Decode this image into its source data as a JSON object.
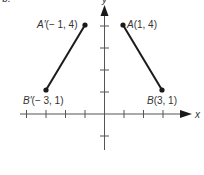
{
  "figure": {
    "part_label": "b.",
    "axis_x_label": "x",
    "axis_y_label": "y",
    "colors": {
      "axis": "#555555",
      "segment": "#1a1a1a",
      "text": "#333333",
      "background": "#ffffff"
    },
    "points": [
      {
        "name": "A",
        "label_name": "A",
        "label_coords": "(1, 4)",
        "x": 1,
        "y": 4
      },
      {
        "name": "B",
        "label_name": "B",
        "label_coords": "(3, 1)",
        "x": 3,
        "y": 1
      },
      {
        "name": "A'",
        "label_name": "A′",
        "label_coords": "(− 1, 4)",
        "x": -1,
        "y": 4
      },
      {
        "name": "B'",
        "label_name": "B′",
        "label_coords": "(− 3, 1)",
        "x": -3,
        "y": 1
      }
    ],
    "segments": [
      {
        "from": "A",
        "to": "B"
      },
      {
        "from": "A'",
        "to": "B'"
      }
    ],
    "x_ticks": [
      -4,
      -3,
      -2,
      -1,
      1,
      2,
      3
    ],
    "y_ticks": [
      -1,
      1,
      2,
      3,
      4
    ]
  }
}
